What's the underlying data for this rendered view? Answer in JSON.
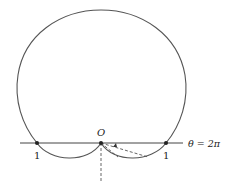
{
  "diagram": {
    "type": "polar-curve",
    "origin_label": "O",
    "left_point_label": "1",
    "right_point_label": "1",
    "axis_label": "θ = 2π",
    "colors": {
      "curve": "#555555",
      "axis": "#444444",
      "text": "#222222",
      "background": "#ffffff"
    }
  }
}
